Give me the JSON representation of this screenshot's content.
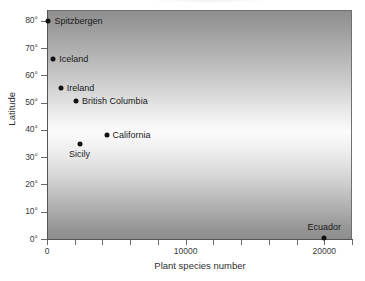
{
  "chart_data": {
    "type": "scatter",
    "title": "",
    "xlabel": "Plant species number",
    "ylabel": "Latitude",
    "xlim": [
      0,
      22000
    ],
    "ylim": [
      0,
      84
    ],
    "grid": false,
    "legend": "none",
    "xticks": [
      {
        "value": 0,
        "label": "0",
        "major": true
      },
      {
        "value": 2000,
        "label": "",
        "major": false
      },
      {
        "value": 4000,
        "label": "",
        "major": false
      },
      {
        "value": 6000,
        "label": "",
        "major": false
      },
      {
        "value": 8000,
        "label": "",
        "major": false
      },
      {
        "value": 10000,
        "label": "10000",
        "major": true
      },
      {
        "value": 12000,
        "label": "",
        "major": false
      },
      {
        "value": 14000,
        "label": "",
        "major": false
      },
      {
        "value": 16000,
        "label": "",
        "major": false
      },
      {
        "value": 18000,
        "label": "",
        "major": false
      },
      {
        "value": 20000,
        "label": "20000",
        "major": true
      },
      {
        "value": 22000,
        "label": "",
        "major": false
      }
    ],
    "yticks": [
      {
        "value": 0,
        "label": "0°"
      },
      {
        "value": 10,
        "label": "10°"
      },
      {
        "value": 20,
        "label": "20°"
      },
      {
        "value": 30,
        "label": "30°"
      },
      {
        "value": 40,
        "label": "40°"
      },
      {
        "value": 50,
        "label": "50°"
      },
      {
        "value": 60,
        "label": "60°"
      },
      {
        "value": 70,
        "label": "70°"
      },
      {
        "value": 80,
        "label": "80°"
      }
    ],
    "points": [
      {
        "label": "Spitzbergen",
        "x": 100,
        "y": 80,
        "label_pos": "right"
      },
      {
        "label": "Iceland",
        "x": 450,
        "y": 66,
        "label_pos": "right"
      },
      {
        "label": "Ireland",
        "x": 1000,
        "y": 55.5,
        "label_pos": "right"
      },
      {
        "label": "British Columbia",
        "x": 2100,
        "y": 50.5,
        "label_pos": "right"
      },
      {
        "label": "California",
        "x": 4300,
        "y": 38,
        "label_pos": "right"
      },
      {
        "label": "Sicily",
        "x": 2350,
        "y": 35,
        "label_pos": "below"
      },
      {
        "label": "Ecuador",
        "x": 20000,
        "y": 0.5,
        "label_pos": "above"
      }
    ],
    "marker_color": "#111111",
    "background_gradient": [
      "#8e8e8e",
      "#fbfbfb",
      "#8d8d8d"
    ]
  }
}
